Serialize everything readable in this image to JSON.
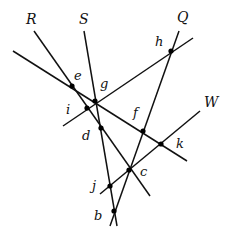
{
  "diagram": {
    "type": "line-arrangement",
    "colors": {
      "line": "#111111",
      "point": "#000000",
      "background": "#ffffff"
    },
    "lines": [
      {
        "id": "R",
        "label": "R",
        "x1": 34,
        "y1": 31,
        "x2": 150,
        "y2": 196,
        "label_x": 26,
        "label_y": 24
      },
      {
        "id": "S",
        "label": "S",
        "x1": 84,
        "y1": 31,
        "x2": 117,
        "y2": 226,
        "label_x": 79,
        "label_y": 24
      },
      {
        "id": "Q",
        "label": "Q",
        "x1": 179,
        "y1": 31,
        "x2": 110,
        "y2": 226,
        "label_x": 177,
        "label_y": 22
      },
      {
        "id": "W",
        "label": "W",
        "x1": 100,
        "y1": 194,
        "x2": 200,
        "y2": 111,
        "label_x": 204,
        "label_y": 107
      },
      {
        "id": "L5",
        "label": "",
        "x1": 13,
        "y1": 51,
        "x2": 187,
        "y2": 161
      },
      {
        "id": "L6",
        "label": "",
        "x1": 63,
        "y1": 126,
        "x2": 193,
        "y2": 38
      }
    ],
    "points": [
      {
        "id": "e",
        "label": "e",
        "x": 72,
        "y": 86,
        "label_x": 74,
        "label_y": 80
      },
      {
        "id": "g",
        "label": "g",
        "x": 95,
        "y": 101,
        "label_x": 100,
        "label_y": 88
      },
      {
        "id": "i",
        "label": "i",
        "x": 87,
        "y": 108,
        "label_x": 66,
        "label_y": 114
      },
      {
        "id": "h",
        "label": "h",
        "x": 171,
        "y": 51,
        "label_x": 155,
        "label_y": 46
      },
      {
        "id": "d",
        "label": "d",
        "x": 101,
        "y": 128,
        "label_x": 82,
        "label_y": 140
      },
      {
        "id": "f",
        "label": "f",
        "x": 143,
        "y": 131,
        "label_x": 133,
        "label_y": 117
      },
      {
        "id": "k",
        "label": "k",
        "x": 161,
        "y": 144,
        "label_x": 176,
        "label_y": 148
      },
      {
        "id": "c",
        "label": "c",
        "x": 129,
        "y": 170,
        "label_x": 140,
        "label_y": 176
      },
      {
        "id": "j",
        "label": "j",
        "x": 110,
        "y": 186,
        "label_x": 92,
        "label_y": 190
      },
      {
        "id": "b",
        "label": "b",
        "x": 114,
        "y": 211,
        "label_x": 94,
        "label_y": 220
      }
    ]
  }
}
